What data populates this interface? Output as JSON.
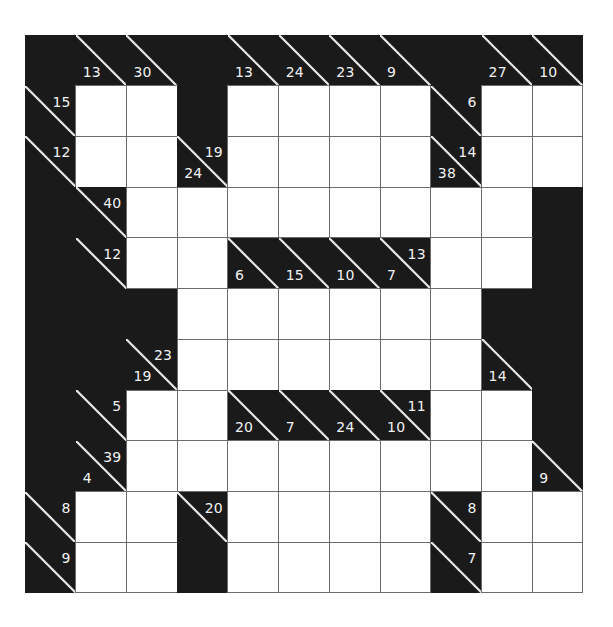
{
  "puzzle": {
    "type": "kakuro",
    "rows": 11,
    "cols": 11,
    "colors": {
      "black": "#1a1a1a",
      "white": "#ffffff",
      "grid_line": "#6b6b6b",
      "clue_text": "#f2f2f2"
    },
    "grid": [
      [
        {
          "t": "B"
        },
        {
          "t": "C",
          "d": "13"
        },
        {
          "t": "C",
          "d": "30"
        },
        {
          "t": "B"
        },
        {
          "t": "C",
          "d": "13"
        },
        {
          "t": "C",
          "d": "24"
        },
        {
          "t": "C",
          "d": "23"
        },
        {
          "t": "C",
          "d": "9"
        },
        {
          "t": "B"
        },
        {
          "t": "C",
          "d": "27"
        },
        {
          "t": "C",
          "d": "10"
        }
      ],
      [
        {
          "t": "C",
          "r": "15"
        },
        {
          "t": "W"
        },
        {
          "t": "W"
        },
        {
          "t": "B"
        },
        {
          "t": "W"
        },
        {
          "t": "W"
        },
        {
          "t": "W"
        },
        {
          "t": "W"
        },
        {
          "t": "C",
          "r": "6"
        },
        {
          "t": "W"
        },
        {
          "t": "W"
        }
      ],
      [
        {
          "t": "C",
          "r": "12"
        },
        {
          "t": "W"
        },
        {
          "t": "W"
        },
        {
          "t": "C",
          "d": "24",
          "r": "19"
        },
        {
          "t": "W"
        },
        {
          "t": "W"
        },
        {
          "t": "W"
        },
        {
          "t": "W"
        },
        {
          "t": "C",
          "d": "38",
          "r": "14"
        },
        {
          "t": "W"
        },
        {
          "t": "W"
        }
      ],
      [
        {
          "t": "B"
        },
        {
          "t": "C",
          "r": "40"
        },
        {
          "t": "W"
        },
        {
          "t": "W"
        },
        {
          "t": "W"
        },
        {
          "t": "W"
        },
        {
          "t": "W"
        },
        {
          "t": "W"
        },
        {
          "t": "W"
        },
        {
          "t": "W"
        },
        {
          "t": "B"
        }
      ],
      [
        {
          "t": "B"
        },
        {
          "t": "C",
          "r": "12"
        },
        {
          "t": "W"
        },
        {
          "t": "W"
        },
        {
          "t": "C",
          "d": "6"
        },
        {
          "t": "C",
          "d": "15"
        },
        {
          "t": "C",
          "d": "10"
        },
        {
          "t": "C",
          "d": "7",
          "r": "13"
        },
        {
          "t": "W"
        },
        {
          "t": "W"
        },
        {
          "t": "B"
        }
      ],
      [
        {
          "t": "B"
        },
        {
          "t": "B"
        },
        {
          "t": "B"
        },
        {
          "t": "W"
        },
        {
          "t": "W"
        },
        {
          "t": "W"
        },
        {
          "t": "W"
        },
        {
          "t": "W"
        },
        {
          "t": "W"
        },
        {
          "t": "B"
        },
        {
          "t": "B"
        }
      ],
      [
        {
          "t": "B"
        },
        {
          "t": "B"
        },
        {
          "t": "C",
          "d": "19",
          "r": "23"
        },
        {
          "t": "W"
        },
        {
          "t": "W"
        },
        {
          "t": "W"
        },
        {
          "t": "W"
        },
        {
          "t": "W"
        },
        {
          "t": "W"
        },
        {
          "t": "C",
          "d": "14"
        },
        {
          "t": "B"
        }
      ],
      [
        {
          "t": "B"
        },
        {
          "t": "C",
          "r": "5"
        },
        {
          "t": "W"
        },
        {
          "t": "W"
        },
        {
          "t": "C",
          "d": "20"
        },
        {
          "t": "C",
          "d": "7"
        },
        {
          "t": "C",
          "d": "24"
        },
        {
          "t": "C",
          "d": "10",
          "r": "11"
        },
        {
          "t": "W"
        },
        {
          "t": "W"
        },
        {
          "t": "B"
        }
      ],
      [
        {
          "t": "B"
        },
        {
          "t": "C",
          "d": "4",
          "r": "39"
        },
        {
          "t": "W"
        },
        {
          "t": "W"
        },
        {
          "t": "W"
        },
        {
          "t": "W"
        },
        {
          "t": "W"
        },
        {
          "t": "W"
        },
        {
          "t": "W"
        },
        {
          "t": "W"
        },
        {
          "t": "C",
          "d": "9"
        }
      ],
      [
        {
          "t": "C",
          "r": "8"
        },
        {
          "t": "W"
        },
        {
          "t": "W"
        },
        {
          "t": "C",
          "r": "20"
        },
        {
          "t": "W"
        },
        {
          "t": "W"
        },
        {
          "t": "W"
        },
        {
          "t": "W"
        },
        {
          "t": "C",
          "r": "8"
        },
        {
          "t": "W"
        },
        {
          "t": "W"
        }
      ],
      [
        {
          "t": "C",
          "r": "9"
        },
        {
          "t": "W"
        },
        {
          "t": "W"
        },
        {
          "t": "B"
        },
        {
          "t": "W"
        },
        {
          "t": "W"
        },
        {
          "t": "W"
        },
        {
          "t": "W"
        },
        {
          "t": "C",
          "r": "7"
        },
        {
          "t": "W"
        },
        {
          "t": "W"
        }
      ]
    ]
  }
}
